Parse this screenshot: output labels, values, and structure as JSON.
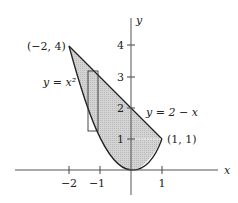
{
  "figure": {
    "axes": {
      "x_label": "x",
      "y_label": "y",
      "x_ticks": [
        {
          "value": -2,
          "label": "−2"
        },
        {
          "value": -1,
          "label": "−1"
        },
        {
          "value": 1,
          "label": "1"
        }
      ],
      "y_ticks": [
        {
          "value": 1,
          "label": "1"
        },
        {
          "value": 2,
          "label": "2"
        },
        {
          "value": 3,
          "label": "3"
        },
        {
          "value": 4,
          "label": "4"
        }
      ]
    },
    "curves": {
      "parabola_label": "y = x²",
      "line_label": "y = 2 − x"
    },
    "points": {
      "left_intersection": "(−2, 4)",
      "right_intersection": "(1, 1)"
    },
    "region": {
      "description": "shaded region between y = x^2 and y = 2 - x from x = -2 to x = 1",
      "fill_color": "#cfcfcf",
      "stroke_color": "#222222"
    },
    "strip": {
      "description": "vertical representative rectangle near x = -1.2"
    }
  }
}
